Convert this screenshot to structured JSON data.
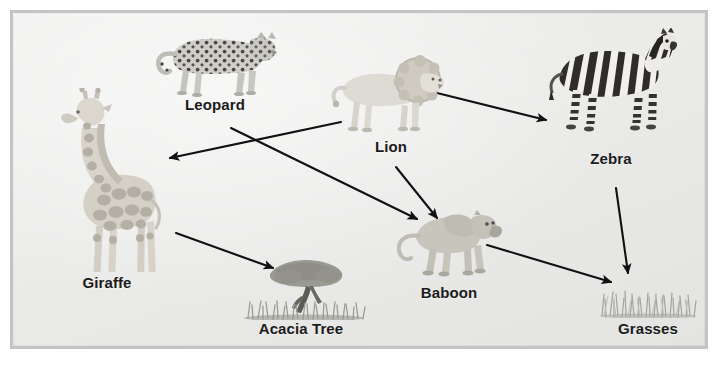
{
  "diagram": {
    "type": "food-web",
    "biome": "African savanna",
    "background_color": "#e9e9e7",
    "frame_color": "#c3c4c3",
    "label_color": "#1b1b1b",
    "arrow_color": "#111111",
    "canvas": {
      "width": 720,
      "height": 367
    }
  },
  "nodes": [
    {
      "id": "leopard",
      "label": "Leopard",
      "icon": "leopard-icon",
      "role": "predator",
      "x": 215,
      "y": 72
    },
    {
      "id": "lion",
      "label": "Lion",
      "icon": "lion-icon",
      "role": "predator",
      "x": 389,
      "y": 106
    },
    {
      "id": "zebra",
      "label": "Zebra",
      "icon": "zebra-icon",
      "role": "herbivore",
      "x": 611,
      "y": 97
    },
    {
      "id": "giraffe",
      "label": "Giraffe",
      "icon": "giraffe-icon",
      "role": "herbivore",
      "x": 107,
      "y": 194
    },
    {
      "id": "acacia",
      "label": "Acacia Tree",
      "icon": "acacia-tree-icon",
      "role": "producer",
      "x": 301,
      "y": 302
    },
    {
      "id": "baboon",
      "label": "Baboon",
      "icon": "baboon-icon",
      "role": "omnivore",
      "x": 449,
      "y": 253
    },
    {
      "id": "grasses",
      "label": "Grasses",
      "icon": "grasses-icon",
      "role": "producer",
      "x": 648,
      "y": 312
    }
  ],
  "arrows": [
    {
      "id": "lion-to-giraffe",
      "from": "lion",
      "to": "giraffe",
      "x1": 341,
      "y1": 122,
      "x2": 170,
      "y2": 158
    },
    {
      "id": "leopard-to-baboon",
      "from": "leopard",
      "to": "baboon",
      "x1": 231,
      "y1": 128,
      "x2": 417,
      "y2": 219
    },
    {
      "id": "lion-to-zebra",
      "from": "lion",
      "to": "zebra",
      "x1": 433,
      "y1": 92,
      "x2": 546,
      "y2": 120
    },
    {
      "id": "lion-to-baboon",
      "from": "lion",
      "to": "baboon",
      "x1": 396,
      "y1": 167,
      "x2": 437,
      "y2": 218
    },
    {
      "id": "giraffe-to-acacia",
      "from": "giraffe",
      "to": "acacia",
      "x1": 176,
      "y1": 233,
      "x2": 273,
      "y2": 268
    },
    {
      "id": "baboon-to-grasses",
      "from": "baboon",
      "to": "grasses",
      "x1": 487,
      "y1": 245,
      "x2": 611,
      "y2": 282
    },
    {
      "id": "zebra-to-grasses",
      "from": "zebra",
      "to": "grasses",
      "x1": 616,
      "y1": 188,
      "x2": 628,
      "y2": 273
    }
  ]
}
